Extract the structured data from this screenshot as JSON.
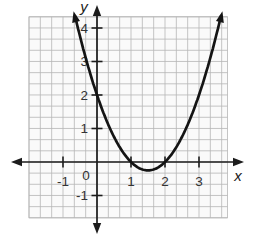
{
  "figure": {
    "colors": {
      "background": "#ffffff",
      "grid_background": "#fafafa",
      "grid_line": "#b6b6b6",
      "axis": "#1c1c1c",
      "curve": "#141414",
      "label": "#333333"
    }
  },
  "chart_data": {
    "type": "line",
    "subtype": "function-plot",
    "title": "",
    "xlabel": "x",
    "ylabel": "y",
    "origin_label": "0",
    "x_tick_labels": [
      "-1",
      "1",
      "2",
      "3"
    ],
    "x_tick_values": [
      -1,
      1,
      2,
      3
    ],
    "y_tick_labels": [
      "4",
      "3",
      "2",
      "1",
      "-1"
    ],
    "y_tick_values": [
      4,
      3,
      2,
      1,
      -1
    ],
    "grid": {
      "visible": true,
      "minor_gridlines_per_unit": 3,
      "xlim": [
        -2,
        3.85
      ],
      "ylim": [
        -1.67,
        4.33
      ]
    },
    "series": [
      {
        "name": "quadratic-curve",
        "coefficients": {
          "a": 1,
          "b": -3,
          "c": 2
        },
        "x_drawn": [
          -0.645,
          3.645
        ],
        "key_points": {
          "x_intercepts": [
            [
              1,
              0
            ],
            [
              2,
              0
            ]
          ],
          "y_intercept": [
            0,
            2
          ],
          "vertex": [
            1.5,
            -0.25
          ]
        },
        "arrows_both_ends": true
      }
    ]
  }
}
